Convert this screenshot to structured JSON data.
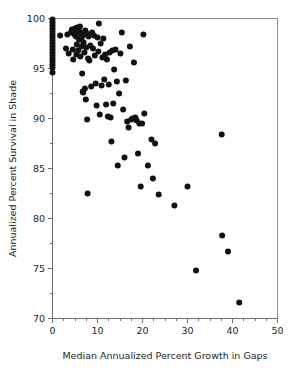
{
  "figure": {
    "background_color": "#ffffff",
    "point_color": "#111111",
    "axis_color": "#6d6e71",
    "frame_color": "#8a8c8e",
    "caption_fragment": ""
  },
  "chart_data": {
    "type": "scatter",
    "title": "",
    "xlabel": "Median Annualized Percent Growth in Gaps",
    "ylabel": "Annualized Percent Survival in Shade",
    "xlim": [
      0,
      50
    ],
    "ylim": [
      70,
      100
    ],
    "xticks": [
      0,
      10,
      20,
      30,
      40,
      50
    ],
    "yticks": [
      70,
      75,
      80,
      85,
      90,
      95,
      100
    ],
    "xtick_labels": [
      "0",
      "10",
      "20",
      "30",
      "40",
      "50"
    ],
    "ytick_labels": [
      "70",
      "75",
      "80",
      "85",
      "90",
      "95",
      "100"
    ],
    "x_minor_tick_interval": 2.5,
    "y_minor_tick_interval": 2.5,
    "grid": false,
    "legend": null,
    "marker": "circle",
    "marker_size": 3.0,
    "n_points": 121,
    "points": [
      [
        0.0,
        99.9
      ],
      [
        0.0,
        99.6
      ],
      [
        0.0,
        99.3
      ],
      [
        0.0,
        99.0
      ],
      [
        0.0,
        98.7
      ],
      [
        0.0,
        98.4
      ],
      [
        0.0,
        98.1
      ],
      [
        0.0,
        97.8
      ],
      [
        0.0,
        97.5
      ],
      [
        0.0,
        97.2
      ],
      [
        0.0,
        96.9
      ],
      [
        0.0,
        96.6
      ],
      [
        0.0,
        96.3
      ],
      [
        0.0,
        96.0
      ],
      [
        0.0,
        95.7
      ],
      [
        0.0,
        95.4
      ],
      [
        0.0,
        95.1
      ],
      [
        0.0,
        94.6
      ],
      [
        1.7,
        98.3
      ],
      [
        3.0,
        97.0
      ],
      [
        3.3,
        98.4
      ],
      [
        3.6,
        96.5
      ],
      [
        4.1,
        98.6
      ],
      [
        4.3,
        98.9
      ],
      [
        4.5,
        96.9
      ],
      [
        4.6,
        95.9
      ],
      [
        4.9,
        98.4
      ],
      [
        5.0,
        99.0
      ],
      [
        5.1,
        98.7
      ],
      [
        5.2,
        98.2
      ],
      [
        5.3,
        96.4
      ],
      [
        5.4,
        97.4
      ],
      [
        5.5,
        99.1
      ],
      [
        5.6,
        98.5
      ],
      [
        5.7,
        96.8
      ],
      [
        5.8,
        98.8
      ],
      [
        5.9,
        97.9
      ],
      [
        6.0,
        98.3
      ],
      [
        6.1,
        99.2
      ],
      [
        6.2,
        96.2
      ],
      [
        6.3,
        98.6
      ],
      [
        6.4,
        97.2
      ],
      [
        6.5,
        98.1
      ],
      [
        6.6,
        94.5
      ],
      [
        6.7,
        92.7
      ],
      [
        6.8,
        92.6
      ],
      [
        6.9,
        97.6
      ],
      [
        7.0,
        98.4
      ],
      [
        7.1,
        96.6
      ],
      [
        7.2,
        93.0
      ],
      [
        7.3,
        98.8
      ],
      [
        7.4,
        91.9
      ],
      [
        7.5,
        97.1
      ],
      [
        7.6,
        98.5
      ],
      [
        7.7,
        89.9
      ],
      [
        7.8,
        82.5
      ],
      [
        7.9,
        96.0
      ],
      [
        8.0,
        98.2
      ],
      [
        8.2,
        95.8
      ],
      [
        8.4,
        97.3
      ],
      [
        8.6,
        93.2
      ],
      [
        8.8,
        98.6
      ],
      [
        9.0,
        97.0
      ],
      [
        9.2,
        98.3
      ],
      [
        9.4,
        96.3
      ],
      [
        9.6,
        93.5
      ],
      [
        9.8,
        91.3
      ],
      [
        10.0,
        98.1
      ],
      [
        10.2,
        96.7
      ],
      [
        10.3,
        99.5
      ],
      [
        10.5,
        90.4
      ],
      [
        10.7,
        97.5
      ],
      [
        10.9,
        93.3
      ],
      [
        11.1,
        96.1
      ],
      [
        11.3,
        98.0
      ],
      [
        11.5,
        93.9
      ],
      [
        11.7,
        96.4
      ],
      [
        11.9,
        91.4
      ],
      [
        12.1,
        95.9
      ],
      [
        12.3,
        90.2
      ],
      [
        12.5,
        93.4
      ],
      [
        12.7,
        96.6
      ],
      [
        12.9,
        90.1
      ],
      [
        13.1,
        87.7
      ],
      [
        13.3,
        96.8
      ],
      [
        13.5,
        91.5
      ],
      [
        13.7,
        94.9
      ],
      [
        14.0,
        96.9
      ],
      [
        14.3,
        93.7
      ],
      [
        14.5,
        85.3
      ],
      [
        14.8,
        92.5
      ],
      [
        15.1,
        96.5
      ],
      [
        15.4,
        98.6
      ],
      [
        15.7,
        90.9
      ],
      [
        16.0,
        86.1
      ],
      [
        16.3,
        93.8
      ],
      [
        16.6,
        89.7
      ],
      [
        16.9,
        89.1
      ],
      [
        17.2,
        97.2
      ],
      [
        17.5,
        89.9
      ],
      [
        17.8,
        90.0
      ],
      [
        18.1,
        95.6
      ],
      [
        18.4,
        90.1
      ],
      [
        18.7,
        89.8
      ],
      [
        19.0,
        86.5
      ],
      [
        19.3,
        89.5
      ],
      [
        19.6,
        83.2
      ],
      [
        19.9,
        89.5
      ],
      [
        20.2,
        98.4
      ],
      [
        20.4,
        90.5
      ],
      [
        21.2,
        85.3
      ],
      [
        22.0,
        87.9
      ],
      [
        22.3,
        84.0
      ],
      [
        22.8,
        87.5
      ],
      [
        23.6,
        82.4
      ],
      [
        27.1,
        81.3
      ],
      [
        30.0,
        83.2
      ],
      [
        31.9,
        74.8
      ],
      [
        37.6,
        88.4
      ],
      [
        37.7,
        78.3
      ],
      [
        39.0,
        76.7
      ],
      [
        41.5,
        71.6
      ]
    ]
  }
}
